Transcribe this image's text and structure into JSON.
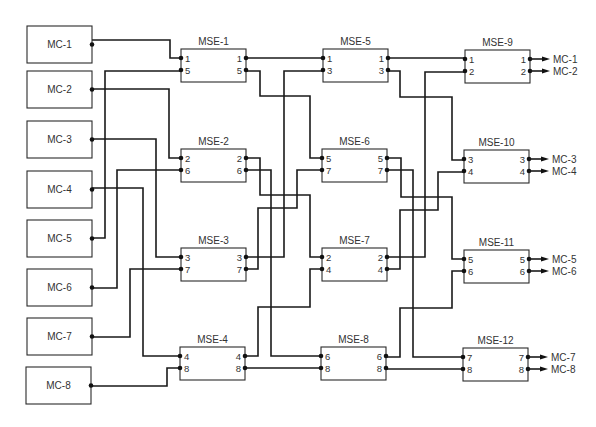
{
  "diagram": {
    "title": "",
    "colors": {
      "line": "#1a1a1a",
      "box": "#2a2a2a",
      "text": "#333333",
      "background": "#ffffff"
    },
    "inputs": [
      {
        "id": "MC-1",
        "label": "MC-1",
        "x": 27,
        "y": 26,
        "w": 65,
        "h": 37
      },
      {
        "id": "MC-2",
        "label": "MC-2",
        "x": 27,
        "y": 71,
        "w": 65,
        "h": 37
      },
      {
        "id": "MC-3",
        "label": "MC-3",
        "x": 27,
        "y": 121,
        "w": 65,
        "h": 37
      },
      {
        "id": "MC-4",
        "label": "MC-4",
        "x": 27,
        "y": 171,
        "w": 65,
        "h": 37
      },
      {
        "id": "MC-5",
        "label": "MC-5",
        "x": 27,
        "y": 220,
        "w": 65,
        "h": 37
      },
      {
        "id": "MC-6",
        "label": "MC-6",
        "x": 27,
        "y": 269,
        "w": 65,
        "h": 37
      },
      {
        "id": "MC-7",
        "label": "MC-7",
        "x": 27,
        "y": 318,
        "w": 65,
        "h": 37
      },
      {
        "id": "MC-8",
        "label": "MC-8",
        "x": 26,
        "y": 367,
        "w": 65,
        "h": 37
      }
    ],
    "switches": [
      {
        "id": "MSE-1",
        "label": "MSE-1",
        "x": 181,
        "y": 49,
        "w": 65,
        "h": 33,
        "ports": [
          "1",
          "5"
        ]
      },
      {
        "id": "MSE-2",
        "label": "MSE-2",
        "x": 181,
        "y": 149,
        "w": 65,
        "h": 33,
        "ports": [
          "2",
          "6"
        ]
      },
      {
        "id": "MSE-3",
        "label": "MSE-3",
        "x": 181,
        "y": 248,
        "w": 65,
        "h": 33,
        "ports": [
          "3",
          "7"
        ]
      },
      {
        "id": "MSE-4",
        "label": "MSE-4",
        "x": 180,
        "y": 347,
        "w": 65,
        "h": 33,
        "ports": [
          "4",
          "8"
        ]
      },
      {
        "id": "MSE-5",
        "label": "MSE-5",
        "x": 323,
        "y": 49,
        "w": 65,
        "h": 33,
        "ports": [
          "1",
          "3"
        ]
      },
      {
        "id": "MSE-6",
        "label": "MSE-6",
        "x": 322,
        "y": 149,
        "w": 65,
        "h": 33,
        "ports": [
          "5",
          "7"
        ]
      },
      {
        "id": "MSE-7",
        "label": "MSE-7",
        "x": 322,
        "y": 248,
        "w": 65,
        "h": 33,
        "ports": [
          "2",
          "4"
        ]
      },
      {
        "id": "MSE-8",
        "label": "MSE-8",
        "x": 321,
        "y": 347,
        "w": 65,
        "h": 33,
        "ports": [
          "6",
          "8"
        ]
      },
      {
        "id": "MSE-9",
        "label": "MSE-9",
        "x": 465,
        "y": 50,
        "w": 65,
        "h": 33,
        "ports": [
          "1",
          "2"
        ]
      },
      {
        "id": "MSE-10",
        "label": "MSE-10",
        "x": 464,
        "y": 150,
        "w": 65,
        "h": 33,
        "ports": [
          "3",
          "4"
        ]
      },
      {
        "id": "MSE-11",
        "label": "MSE-11",
        "x": 464,
        "y": 250,
        "w": 65,
        "h": 33,
        "ports": [
          "5",
          "6"
        ]
      },
      {
        "id": "MSE-12",
        "label": "MSE-12",
        "x": 463,
        "y": 348,
        "w": 65,
        "h": 33,
        "ports": [
          "7",
          "8"
        ]
      }
    ],
    "outputs": [
      {
        "label": "MC-1",
        "y": 60
      },
      {
        "label": "MC-2",
        "y": 72
      },
      {
        "label": "MC-3",
        "y": 160
      },
      {
        "label": "MC-4",
        "y": 172
      },
      {
        "label": "MC-5",
        "y": 259
      },
      {
        "label": "MC-6",
        "y": 271
      },
      {
        "label": "MC-7",
        "y": 358
      },
      {
        "label": "MC-8",
        "y": 370
      }
    ],
    "wires": [
      {
        "from": "MC-1",
        "to": "MSE-1.in.1",
        "points": [
          [
            92,
            40
          ],
          [
            170,
            40
          ],
          [
            170,
            58
          ],
          [
            181,
            58
          ]
        ]
      },
      {
        "from": "MC-2",
        "to": "MSE-2.in.2",
        "points": [
          [
            92,
            89
          ],
          [
            169,
            89
          ],
          [
            169,
            158
          ],
          [
            181,
            158
          ]
        ]
      },
      {
        "from": "MC-3",
        "to": "MSE-3.in.3",
        "points": [
          [
            92,
            139
          ],
          [
            156,
            139
          ],
          [
            156,
            257
          ],
          [
            181,
            257
          ]
        ]
      },
      {
        "from": "MC-4",
        "to": "MSE-4.in.4",
        "points": [
          [
            92,
            188
          ],
          [
            143,
            188
          ],
          [
            143,
            356
          ],
          [
            180,
            356
          ]
        ]
      },
      {
        "from": "MC-5",
        "to": "MSE-1.in.5",
        "points": [
          [
            92,
            238
          ],
          [
            105,
            238
          ],
          [
            105,
            71
          ],
          [
            181,
            71
          ]
        ]
      },
      {
        "from": "MC-6",
        "to": "MSE-2.in.6",
        "points": [
          [
            92,
            288
          ],
          [
            117,
            288
          ],
          [
            117,
            170
          ],
          [
            181,
            170
          ]
        ]
      },
      {
        "from": "MC-7",
        "to": "MSE-3.in.7",
        "points": [
          [
            92,
            337
          ],
          [
            130,
            337
          ],
          [
            130,
            269
          ],
          [
            181,
            269
          ]
        ]
      },
      {
        "from": "MC-8",
        "to": "MSE-4.in.8",
        "points": [
          [
            91,
            386
          ],
          [
            167,
            386
          ],
          [
            167,
            368
          ],
          [
            180,
            368
          ]
        ]
      },
      {
        "from": "MSE-1.out.1",
        "to": "MSE-5.in.1",
        "points": [
          [
            246,
            58
          ],
          [
            323,
            58
          ]
        ]
      },
      {
        "from": "MSE-1.out.5",
        "to": "MSE-6.in.5",
        "points": [
          [
            246,
            71
          ],
          [
            260,
            71
          ],
          [
            260,
            96
          ],
          [
            310,
            96
          ],
          [
            310,
            158
          ],
          [
            322,
            158
          ]
        ]
      },
      {
        "from": "MSE-2.out.2",
        "to": "MSE-7.in.2",
        "points": [
          [
            246,
            158
          ],
          [
            260,
            158
          ],
          [
            260,
            195
          ],
          [
            310,
            195
          ],
          [
            310,
            257
          ],
          [
            322,
            257
          ]
        ]
      },
      {
        "from": "MSE-2.out.6",
        "to": "MSE-8.in.6",
        "points": [
          [
            246,
            170
          ],
          [
            271,
            170
          ],
          [
            271,
            356
          ],
          [
            321,
            356
          ]
        ]
      },
      {
        "from": "MSE-3.out.3",
        "to": "MSE-5.in.3",
        "points": [
          [
            246,
            257
          ],
          [
            284,
            257
          ],
          [
            284,
            71
          ],
          [
            323,
            71
          ]
        ]
      },
      {
        "from": "MSE-3.out.7",
        "to": "MSE-6.in.7",
        "points": [
          [
            246,
            269
          ],
          [
            258,
            269
          ],
          [
            258,
            208
          ],
          [
            297,
            208
          ],
          [
            297,
            170
          ],
          [
            322,
            170
          ]
        ]
      },
      {
        "from": "MSE-4.out.4",
        "to": "MSE-7.in.4",
        "points": [
          [
            245,
            356
          ],
          [
            258,
            356
          ],
          [
            258,
            307
          ],
          [
            310,
            307
          ],
          [
            310,
            269
          ],
          [
            322,
            269
          ]
        ]
      },
      {
        "from": "MSE-4.out.8",
        "to": "MSE-8.in.8",
        "points": [
          [
            245,
            368
          ],
          [
            321,
            368
          ]
        ]
      },
      {
        "from": "MSE-5.out.1",
        "to": "MSE-9.in.1",
        "points": [
          [
            388,
            58
          ],
          [
            465,
            58
          ]
        ]
      },
      {
        "from": "MSE-5.out.3",
        "to": "MSE-10.in.3",
        "points": [
          [
            388,
            71
          ],
          [
            400,
            71
          ],
          [
            400,
            97
          ],
          [
            452,
            97
          ],
          [
            452,
            160
          ],
          [
            464,
            160
          ]
        ]
      },
      {
        "from": "MSE-6.out.5",
        "to": "MSE-11.in.5",
        "points": [
          [
            387,
            158
          ],
          [
            401,
            158
          ],
          [
            401,
            197
          ],
          [
            452,
            197
          ],
          [
            452,
            259
          ],
          [
            464,
            259
          ]
        ]
      },
      {
        "from": "MSE-6.out.7",
        "to": "MSE-12.in.7",
        "points": [
          [
            387,
            170
          ],
          [
            413,
            170
          ],
          [
            413,
            357
          ],
          [
            463,
            357
          ]
        ]
      },
      {
        "from": "MSE-7.out.2",
        "to": "MSE-9.in.2",
        "points": [
          [
            387,
            257
          ],
          [
            425,
            257
          ],
          [
            425,
            72
          ],
          [
            465,
            72
          ]
        ]
      },
      {
        "from": "MSE-7.out.4",
        "to": "MSE-10.in.4",
        "points": [
          [
            387,
            269
          ],
          [
            400,
            269
          ],
          [
            400,
            210
          ],
          [
            438,
            210
          ],
          [
            438,
            172
          ],
          [
            464,
            172
          ]
        ]
      },
      {
        "from": "MSE-8.out.6",
        "to": "MSE-11.in.6",
        "points": [
          [
            386,
            357
          ],
          [
            400,
            357
          ],
          [
            400,
            308
          ],
          [
            452,
            308
          ],
          [
            452,
            271
          ],
          [
            464,
            271
          ]
        ]
      },
      {
        "from": "MSE-8.out.8",
        "to": "MSE-12.in.8",
        "points": [
          [
            386,
            369
          ],
          [
            463,
            369
          ]
        ]
      }
    ]
  }
}
